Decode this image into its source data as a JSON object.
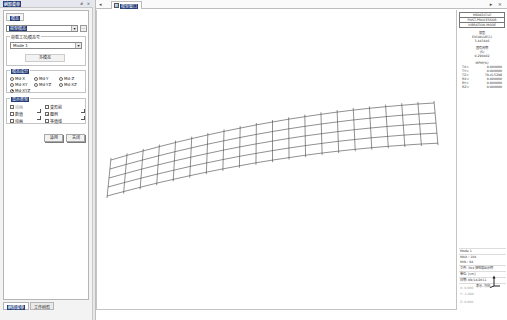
{
  "left_panel": {
    "title": "树形菜单",
    "title_controls": "# ×",
    "tab": "模态",
    "result_select": "振型模态",
    "ellipsis": "...",
    "load_case_group": {
      "label": "荷载工况/模态号",
      "value": "Mode 1",
      "mode_button": "多模态"
    },
    "mode_component_group": {
      "label": "模态成分",
      "options": [
        {
          "label": "Md-X",
          "selected": false
        },
        {
          "label": "Md-Y",
          "selected": false
        },
        {
          "label": "Md-Z",
          "selected": false
        },
        {
          "label": "Md-XY",
          "selected": false
        },
        {
          "label": "Md-YZ",
          "selected": false
        },
        {
          "label": "Md-XZ",
          "selected": false
        },
        {
          "label": "Md-XYZ",
          "selected": true
        }
      ]
    },
    "display_type_group": {
      "label": "显示类型",
      "options": [
        {
          "label": "动画",
          "checked": true,
          "disabled": true
        },
        {
          "label": "变形前",
          "checked": false,
          "disabled": false
        },
        {
          "label": "数值",
          "checked": false,
          "disabled": false
        },
        {
          "label": "图例",
          "checked": true,
          "disabled": false
        },
        {
          "label": "动画",
          "checked": false,
          "disabled": false
        },
        {
          "label": "等值线",
          "checked": false,
          "disabled": false
        }
      ]
    },
    "apply_button": "适用",
    "close_button": "关闭",
    "bottom_tabs": [
      {
        "label": "树形菜单",
        "active": true
      },
      {
        "label": "工作树形",
        "active": false
      }
    ]
  },
  "main": {
    "tab_nav": "◂",
    "tab_label": "模型窗口",
    "window_controls": "▸ ×"
  },
  "info_panel": {
    "header": [
      "MIDAS/Civil",
      "POST-PROCESSOR",
      "VIBRATION MODE"
    ],
    "mode_title": "振型",
    "mode_sub": "EIGVALUE(1)",
    "freq_value": "3.443446",
    "period_label": "固有周期",
    "period_unit": "(S)",
    "period_value": "0.290402",
    "mass_title": "MPM(%)",
    "mass_rows": [
      {
        "k": "TX=",
        "v": "0.000000"
      },
      {
        "k": "TY=",
        "v": "0.000000"
      },
      {
        "k": "TZ=",
        "v": "79.415298"
      },
      {
        "k": "RX=",
        "v": "0.000000"
      },
      {
        "k": "RY=",
        "v": "0.000000"
      },
      {
        "k": "RZ=",
        "v": "0.000000"
      }
    ],
    "bottom_lines": [
      "Mode 1",
      "MAX : 104",
      "MIN : 94",
      "文件: 304 弹性振动示例",
      "单位: [cm]",
      "日期: 09/14/2011"
    ],
    "view_label": "表示-方向",
    "scale_lines": [
      "X: 0.000",
      "Y: -1.000",
      "Z: 0.000"
    ]
  },
  "colors": {
    "highlight": "#1f3a78",
    "mesh": "#444444",
    "panel_bg": "#f3f3f3"
  }
}
